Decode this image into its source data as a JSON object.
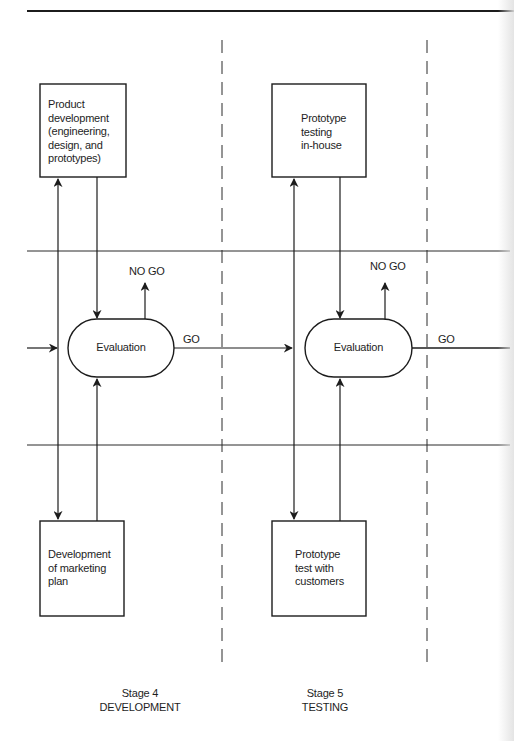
{
  "diagram": {
    "type": "flowchart",
    "stages": [
      {
        "number_label": "Stage 4",
        "name_label": "DEVELOPMENT",
        "top_box": "Product development (engineering, design, and prototypes)",
        "top_box_lines": [
          "Product",
          "development",
          "(engineering,",
          "design, and",
          "prototypes)"
        ],
        "bottom_box": "Development of marketing plan",
        "bottom_box_lines": [
          "Development",
          "of marketing",
          "plan"
        ],
        "evaluation_label": "Evaluation",
        "no_go_label": "NO GO",
        "go_label": "GO"
      },
      {
        "number_label": "Stage 5",
        "name_label": "TESTING",
        "top_box": "Prototype testing in-house",
        "top_box_lines": [
          "Prototype",
          "testing",
          "in-house"
        ],
        "bottom_box": "Prototype test with customers",
        "bottom_box_lines": [
          "Prototype",
          "test with",
          "customers"
        ],
        "evaluation_label": "Evaluation",
        "no_go_label": "NO GO",
        "go_label": "GO"
      }
    ],
    "colors": {
      "line": "#1c1c1c",
      "background": "#ffffff"
    }
  }
}
